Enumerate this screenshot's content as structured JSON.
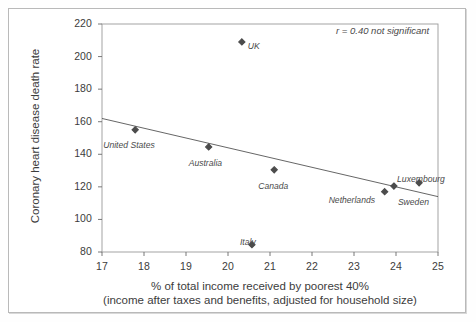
{
  "chart_data": {
    "type": "scatter",
    "title": "",
    "xlabel_line1": "% of total income received by poorest 40%",
    "xlabel_line2": "(income after taxes and benefits, adjusted for household size)",
    "ylabel": "Coronary heart disease death rate",
    "xlim": [
      17,
      25
    ],
    "ylim": [
      80,
      220
    ],
    "xticks": [
      "17",
      "18",
      "19",
      "20",
      "21",
      "22",
      "23",
      "24",
      "25"
    ],
    "yticks": [
      "80",
      "100",
      "120",
      "140",
      "160",
      "180",
      "200",
      "220"
    ],
    "grid": false,
    "legend": "none",
    "annotation": "r = 0.40 not significant",
    "correlation": 0.4,
    "significance": "not significant",
    "marker_color": "#4c4c4c",
    "line_color": "#555555",
    "points": [
      {
        "label": "United States",
        "x": 17.79,
        "y": 155.0,
        "label_dx": -32,
        "label_dy": 10
      },
      {
        "label": "Australia",
        "x": 19.54,
        "y": 144.5,
        "label_dx": -20,
        "label_dy": 11
      },
      {
        "label": "UK",
        "x": 20.33,
        "y": 209.0,
        "label_dx": 6,
        "label_dy": -1
      },
      {
        "label": "Italy",
        "x": 20.57,
        "y": 84.5,
        "label_dx": -12,
        "label_dy": -8
      },
      {
        "label": "Canada",
        "x": 21.1,
        "y": 130.5,
        "label_dx": -16,
        "label_dy": 11
      },
      {
        "label": "Netherlands",
        "x": 23.73,
        "y": 117.0,
        "label_dx": -56,
        "label_dy": 3
      },
      {
        "label": "Sweden",
        "x": 23.95,
        "y": 120.5,
        "label_dx": 4,
        "label_dy": 11
      },
      {
        "label": "Luxembourg",
        "x": 24.55,
        "y": 122.5,
        "label_dx": -22,
        "label_dy": -9
      }
    ],
    "trend_line": {
      "x_start": 17.0,
      "y_start": 162.0,
      "x_end": 25.0,
      "y_end": 114.0
    }
  }
}
